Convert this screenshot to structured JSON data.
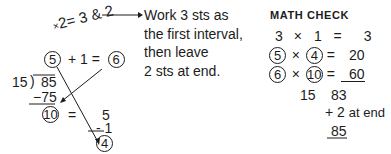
{
  "left_calc": {
    "slanted_expr": "2= 3 & 2",
    "slanted_prefix": "×",
    "row1": {
      "circled_a": "5",
      "op": "+ 1 =",
      "circled_b": "6"
    },
    "divisor": "15",
    "bracket": ")",
    "dividend": "85",
    "subtract": "−75",
    "remainder_circled": "10",
    "equals": "=",
    "five": "5",
    "minus_one": "- 1",
    "result_circled": "4"
  },
  "note": {
    "lines": [
      "Work 3 sts as",
      "the first interval,",
      "then leave",
      "2 sts at end."
    ]
  },
  "math_check": {
    "heading": "MATH CHECK",
    "rows": [
      {
        "a": "3",
        "x": "×",
        "b": "1",
        "eq": "=",
        "r": "3"
      },
      {
        "a": "5",
        "x": "×",
        "b": "4",
        "eq": "=",
        "r": "20"
      },
      {
        "a": "6",
        "x": "×",
        "b": "10",
        "eq": "=",
        "r": "60"
      }
    ],
    "sum_left": "15",
    "sum_right": "83",
    "plus_line": "+ 2",
    "at_end": "at end",
    "total": "85"
  }
}
